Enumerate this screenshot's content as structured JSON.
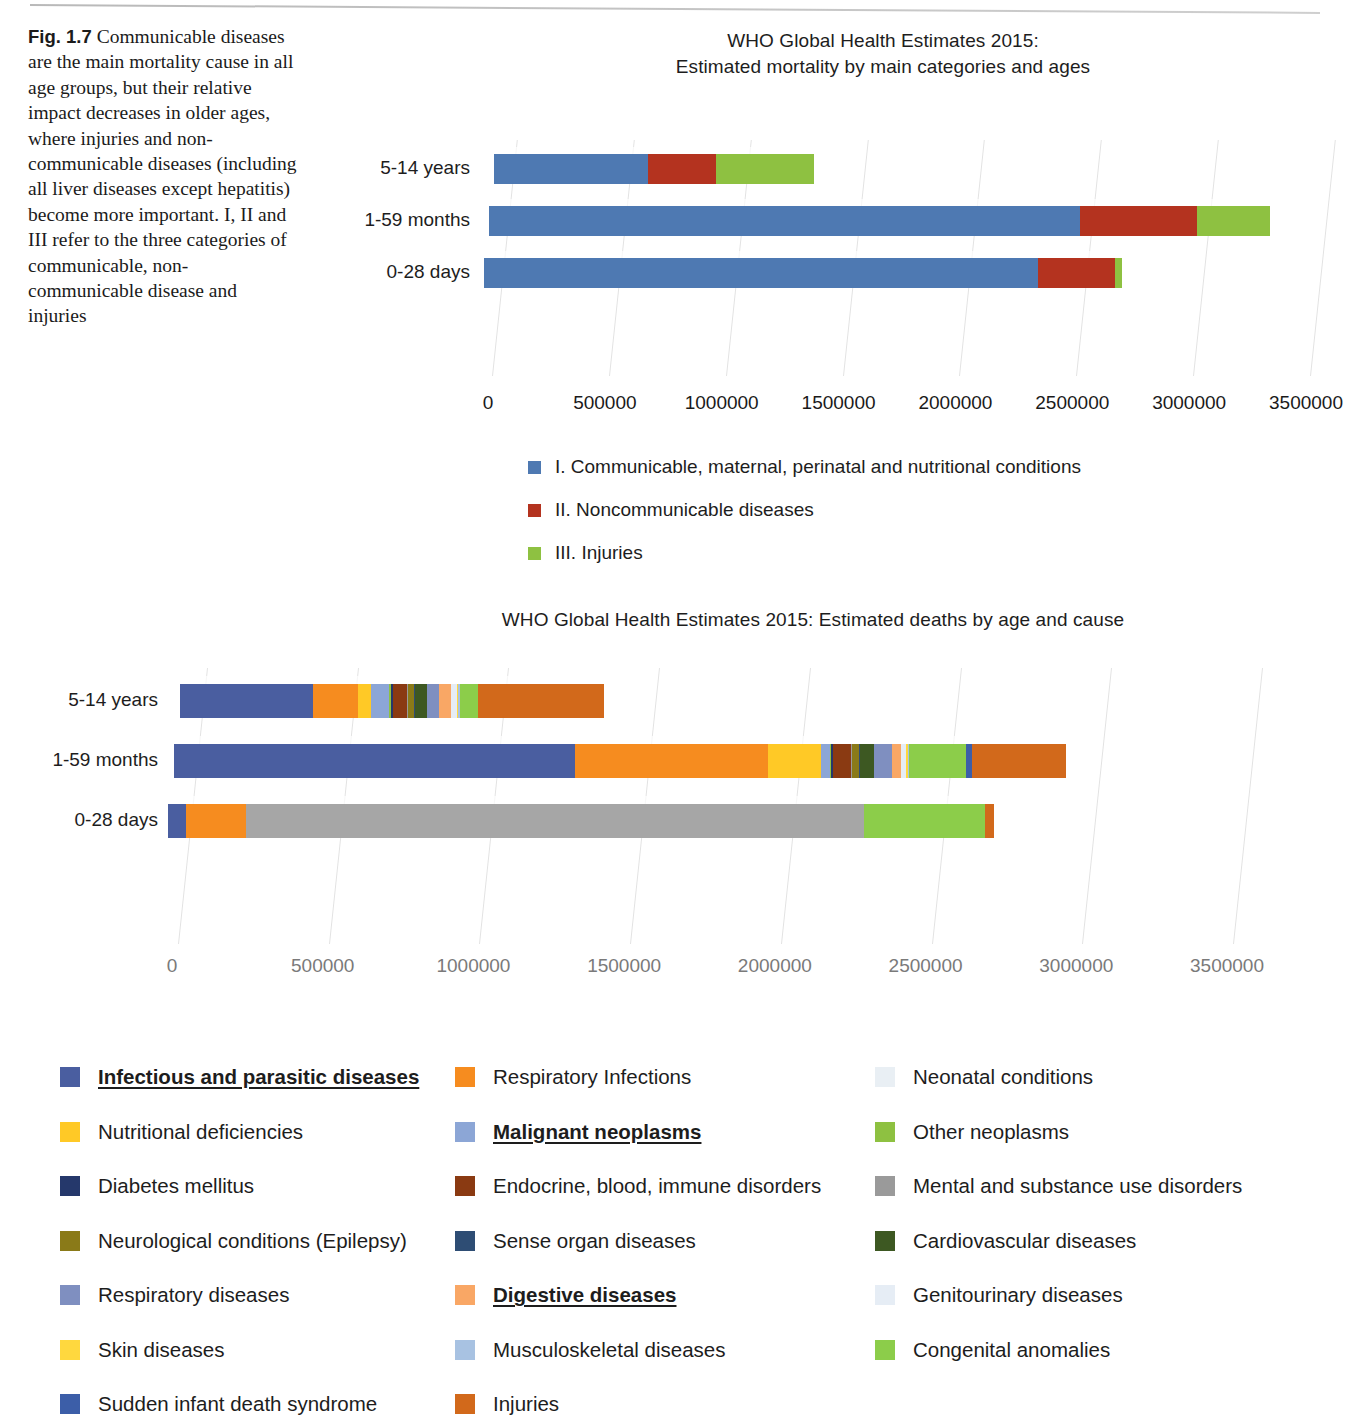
{
  "caption": {
    "label": "Fig. 1.7",
    "text": "Communicable diseases are the main mortality cause in all age groups, but their relative impact decreases in older ages, where injuries and non-communicable diseases (including all liver diseases except hepatitis) become more important. I, II and III refer to the three categories of communicable, non-communicable disease and injuries"
  },
  "chart_data": [
    {
      "id": "chart1",
      "type": "bar",
      "orientation": "horizontal",
      "stacked": true,
      "title": "WHO Global Health Estimates 2015:\nEstimated mortality by main categories and ages",
      "title_line1": "WHO Global Health Estimates 2015:",
      "title_line2": "Estimated mortality by main categories and ages",
      "xlabel": "",
      "ylabel": "",
      "xlim": [
        0,
        3500000
      ],
      "grid": true,
      "legend_position": "bottom",
      "categories": [
        "5-14 years",
        "1-59 months",
        "0-28 days"
      ],
      "tick_labels": [
        "0",
        "500000",
        "1000000",
        "1500000",
        "2000000",
        "2500000",
        "3000000",
        "3500000"
      ],
      "tick_values": [
        0,
        500000,
        1000000,
        1500000,
        2000000,
        2500000,
        3000000,
        3500000
      ],
      "series": [
        {
          "name": "I. Communicable, maternal, perinatal and nutritional conditions",
          "color": "#4e79b2",
          "values": [
            660000,
            2530000,
            2370000
          ]
        },
        {
          "name": "II. Noncommunicable diseases",
          "color": "#b4331f",
          "values": [
            290000,
            500000,
            330000
          ]
        },
        {
          "name": "III. Injuries",
          "color": "#8ec141",
          "values": [
            420000,
            310000,
            30000
          ]
        }
      ],
      "totals": [
        1370000,
        3340000,
        2730000
      ]
    },
    {
      "id": "chart2",
      "type": "bar",
      "orientation": "horizontal",
      "stacked": true,
      "title": "WHO Global Health Estimates 2015: Estimated deaths by age and cause",
      "xlabel": "",
      "ylabel": "",
      "xlim": [
        0,
        3500000
      ],
      "grid": true,
      "legend_position": "bottom",
      "categories": [
        "5-14 years",
        "1-59 months",
        "0-28 days"
      ],
      "tick_labels": [
        "0",
        "500000",
        "1000000",
        "1500000",
        "2000000",
        "2500000",
        "3000000",
        "3500000"
      ],
      "tick_values": [
        0,
        500000,
        1000000,
        1500000,
        2000000,
        2500000,
        3000000,
        3500000
      ],
      "series": [
        {
          "name": "Infectious and parasitic diseases",
          "color": "#4a5ea0",
          "values": [
            440000,
            1330000,
            60000
          ]
        },
        {
          "name": "Respiratory Infections",
          "color": "#f68c1f",
          "values": [
            150000,
            640000,
            200000
          ]
        },
        {
          "name": "Neonatal conditions",
          "color": "#a6a6a6",
          "values": [
            0,
            0,
            2050000
          ]
        },
        {
          "name": "Nutritional deficiencies",
          "color": "#ffc926",
          "values": [
            45000,
            175000,
            0
          ]
        },
        {
          "name": "Malignant neoplasms",
          "color": "#8ca6d6",
          "values": [
            60000,
            30000,
            0
          ]
        },
        {
          "name": "Other neoplasms",
          "color": "#8ec141",
          "values": [
            6000,
            6000,
            0
          ]
        },
        {
          "name": "Diabetes mellitus",
          "color": "#25386b",
          "values": [
            6000,
            5000,
            0
          ]
        },
        {
          "name": "Endocrine, blood, immune disorders",
          "color": "#8a3a12",
          "values": [
            46000,
            60000,
            0
          ]
        },
        {
          "name": "Mental and substance use disorders",
          "color": "#9a9a9a",
          "values": [
            4000,
            4000,
            0
          ]
        },
        {
          "name": "Neurological conditions (Epilepsy)",
          "color": "#8a7a18",
          "values": [
            20000,
            24000,
            0
          ]
        },
        {
          "name": "Sense organ diseases",
          "color": "#2e4d74",
          "values": [
            3000,
            3000,
            0
          ]
        },
        {
          "name": "Cardiovascular diseases",
          "color": "#3d5822",
          "values": [
            40000,
            44000,
            0
          ]
        },
        {
          "name": "Respiratory diseases",
          "color": "#7f8fc0",
          "values": [
            40000,
            60000,
            0
          ]
        },
        {
          "name": "Digestive diseases",
          "color": "#f9a765",
          "values": [
            40000,
            30000,
            0
          ]
        },
        {
          "name": "Genitourinary diseases",
          "color": "#e6edf5",
          "values": [
            18000,
            18000,
            0
          ]
        },
        {
          "name": "Skin diseases",
          "color": "#ffd83e",
          "values": [
            6000,
            6000,
            0
          ]
        },
        {
          "name": "Musculoskeletal diseases",
          "color": "#a8c2e2",
          "values": [
            4000,
            4000,
            0
          ]
        },
        {
          "name": "Congenital anomalies",
          "color": "#8ccd4a",
          "values": [
            60000,
            190000,
            400000
          ]
        },
        {
          "name": "Sudden infant death syndrome",
          "color": "#3c5ea8",
          "values": [
            0,
            20000,
            0
          ]
        },
        {
          "name": "Injuries",
          "color": "#d2691b",
          "values": [
            420000,
            310000,
            30000
          ]
        }
      ],
      "totals": [
        1370000,
        3340000,
        2730000
      ]
    }
  ],
  "chart1_legend": [
    {
      "label": "I. Communicable, maternal, perinatal and nutritional conditions",
      "color": "#4e79b2"
    },
    {
      "label": "II. Noncommunicable diseases",
      "color": "#b4331f"
    },
    {
      "label": "III. Injuries",
      "color": "#8ec141"
    }
  ],
  "chart2_legend": [
    {
      "label": "Infectious and parasitic diseases",
      "color": "#4a5ea0",
      "highlight": true
    },
    {
      "label": "Respiratory Infections",
      "color": "#f68c1f",
      "highlight": false
    },
    {
      "label": "Neonatal conditions",
      "color": "#e9eff4",
      "highlight": false
    },
    {
      "label": "Nutritional deficiencies",
      "color": "#ffc926",
      "highlight": false
    },
    {
      "label": "Malignant neoplasms",
      "color": "#8ca6d6",
      "highlight": true
    },
    {
      "label": "Other neoplasms",
      "color": "#8ec141",
      "highlight": false
    },
    {
      "label": "Diabetes mellitus",
      "color": "#25386b",
      "highlight": false
    },
    {
      "label": "Endocrine, blood, immune disorders",
      "color": "#8a3a12",
      "highlight": false
    },
    {
      "label": "Mental and substance use disorders",
      "color": "#9a9a9a",
      "highlight": false
    },
    {
      "label": "Neurological conditions (Epilepsy)",
      "color": "#8a7a18",
      "highlight": false
    },
    {
      "label": "Sense organ diseases",
      "color": "#2e4d74",
      "highlight": false
    },
    {
      "label": "Cardiovascular diseases",
      "color": "#3d5822",
      "highlight": false
    },
    {
      "label": "Respiratory diseases",
      "color": "#7f8fc0",
      "highlight": false
    },
    {
      "label": "Digestive diseases",
      "color": "#f9a765",
      "highlight": true
    },
    {
      "label": "Genitourinary diseases",
      "color": "#e6edf5",
      "highlight": false
    },
    {
      "label": "Skin diseases",
      "color": "#ffd83e",
      "highlight": false
    },
    {
      "label": "Musculoskeletal diseases",
      "color": "#a8c2e2",
      "highlight": false
    },
    {
      "label": "Congenital anomalies",
      "color": "#8ccd4a",
      "highlight": false
    },
    {
      "label": "Sudden infant death syndrome",
      "color": "#3c5ea8",
      "highlight": false
    },
    {
      "label": "Injuries",
      "color": "#d2691b",
      "highlight": false
    }
  ]
}
